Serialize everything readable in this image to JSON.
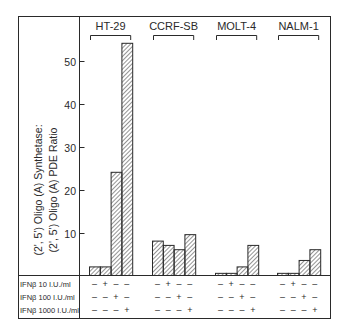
{
  "chart_data": {
    "type": "bar",
    "title": "",
    "xlabel": "",
    "ylabel": "(2', 5') Oligo (A) Synthetase: (2', 5') Oligo (A) PDE Ratio",
    "ylabel_lines": [
      "(2', 5') Oligo (A) Synthetase:",
      "(2', 5') Oligo (A) PDE Ratio"
    ],
    "ylim": [
      0,
      55
    ],
    "yticks": [
      10,
      20,
      30,
      40,
      50
    ],
    "grid": false,
    "legend": "none",
    "bar_pattern": "diagonal-hatch",
    "groups": [
      {
        "name": "HT-29",
        "values": [
          2,
          2,
          24,
          54
        ]
      },
      {
        "name": "CCRF-SB",
        "values": [
          8,
          7,
          6,
          9.5
        ]
      },
      {
        "name": "MOLT-4",
        "values": [
          0.5,
          0.5,
          2,
          7
        ]
      },
      {
        "name": "NALM-1",
        "values": [
          0.5,
          0.5,
          3.5,
          6
        ]
      }
    ],
    "treatment_table": {
      "rows": [
        {
          "label": "IFNβ 10 I.U./ml",
          "signs": [
            "–",
            "+",
            "–",
            "–"
          ]
        },
        {
          "label": "IFNβ 100 I.U./ml",
          "signs": [
            "–",
            "–",
            "+",
            "–"
          ]
        },
        {
          "label": "IFNβ 1000 I.U./ml",
          "signs": [
            "–",
            "–",
            "–",
            "+"
          ]
        }
      ]
    },
    "colors": {
      "line": "#2a2a2a",
      "hatch": "#3a3a3a",
      "background": "#ffffff"
    }
  }
}
